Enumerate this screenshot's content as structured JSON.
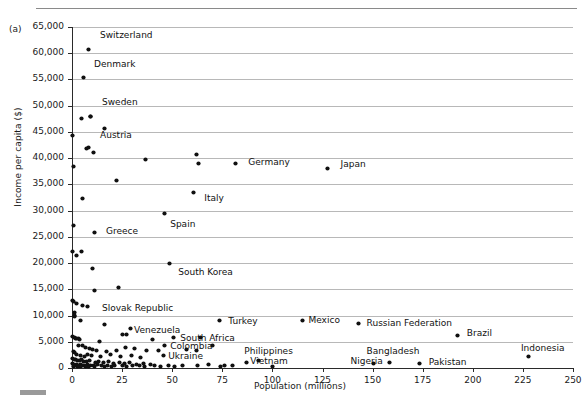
{
  "figure": {
    "panel_label": "(a)"
  },
  "chart_data": {
    "type": "scatter",
    "title": "",
    "xlabel": "Population (millions)",
    "ylabel": "Income per capita ($)",
    "xlim": [
      0,
      250
    ],
    "ylim": [
      0,
      65000
    ],
    "xticks": [
      0,
      25,
      50,
      75,
      100,
      125,
      150,
      175,
      200,
      225,
      250
    ],
    "xtick_labels": [
      "0",
      "25",
      "50",
      "75",
      "100",
      "125",
      "150",
      "175",
      "200",
      "225",
      "250"
    ],
    "yticks": [
      0,
      5000,
      10000,
      15000,
      20000,
      25000,
      30000,
      35000,
      40000,
      45000,
      50000,
      55000,
      60000,
      65000
    ],
    "ytick_labels": [
      "0",
      "5,000",
      "10,000",
      "15,000",
      "20,000",
      "25,000",
      "30,000",
      "35,000",
      "40,000",
      "45,000",
      "50,000",
      "55,000",
      "60,000",
      "65,000"
    ],
    "grid": "horizontal",
    "legend": "none",
    "marker": "filled-diamond",
    "marker_color": "#111111",
    "labeled_points": [
      {
        "name": "Switzerland",
        "x": 8.1,
        "y": 60800,
        "lx": 14,
        "ly": 63300
      },
      {
        "name": "Denmark",
        "x": 5.6,
        "y": 55300,
        "lx": 11,
        "ly": 57800
      },
      {
        "name": "Sweden",
        "x": 9.4,
        "y": 48000,
        "lx": 15,
        "ly": 50500
      },
      {
        "name": "Austria",
        "x": 8.4,
        "y": 42000,
        "lx": 14,
        "ly": 44200
      },
      {
        "name": "Germany",
        "x": 81.8,
        "y": 39000,
        "lx": 88,
        "ly": 39000
      },
      {
        "name": "Japan",
        "x": 127.6,
        "y": 38000,
        "lx": 134,
        "ly": 38600
      },
      {
        "name": "Italy",
        "x": 60.5,
        "y": 33500,
        "lx": 66,
        "ly": 32200
      },
      {
        "name": "Spain",
        "x": 46.2,
        "y": 29400,
        "lx": 49,
        "ly": 27300
      },
      {
        "name": "Greece",
        "x": 11.3,
        "y": 25800,
        "lx": 17,
        "ly": 25900
      },
      {
        "name": "South Korea",
        "x": 48.9,
        "y": 19900,
        "lx": 53,
        "ly": 18100
      },
      {
        "name": "Slovak Republic",
        "x": 5.4,
        "y": 11900,
        "lx": 15,
        "ly": 11300
      },
      {
        "name": "Venezuela",
        "x": 29.0,
        "y": 7600,
        "lx": 31,
        "ly": 7100
      },
      {
        "name": "South Africa",
        "x": 50.5,
        "y": 5800,
        "lx": 54,
        "ly": 5600
      },
      {
        "name": "Turkey",
        "x": 73.6,
        "y": 9000,
        "lx": 78,
        "ly": 8800
      },
      {
        "name": "Mexico",
        "x": 114.8,
        "y": 9100,
        "lx": 118,
        "ly": 9000
      },
      {
        "name": "Russian Federation",
        "x": 142.9,
        "y": 8500,
        "lx": 147,
        "ly": 8400
      },
      {
        "name": "Brazil",
        "x": 192.4,
        "y": 6200,
        "lx": 197,
        "ly": 6500
      },
      {
        "name": "Colombia",
        "x": 46.3,
        "y": 4200,
        "lx": 49,
        "ly": 4000
      },
      {
        "name": "Ukraine",
        "x": 45.7,
        "y": 2400,
        "lx": 48,
        "ly": 2100
      },
      {
        "name": "Philippines",
        "x": 93.3,
        "y": 1500,
        "lx": 86,
        "ly": 3000
      },
      {
        "name": "Vietnam",
        "x": 86.9,
        "y": 1000,
        "lx": 89,
        "ly": 1100
      },
      {
        "name": "Nigeria",
        "x": 158.4,
        "y": 1100,
        "lx": 139,
        "ly": 1100
      },
      {
        "name": "Bangladesh",
        "x": 150.5,
        "y": 800,
        "lx": 147,
        "ly": 3000
      },
      {
        "name": "Pakistan",
        "x": 173.6,
        "y": 900,
        "lx": 178,
        "ly": 1000
      },
      {
        "name": "Indonesia",
        "x": 228.0,
        "y": 2100,
        "lx": 224,
        "ly": 3600
      }
    ],
    "unlabeled_points": [
      {
        "x": 0.5,
        "y": 38500
      },
      {
        "x": 4.6,
        "y": 47500
      },
      {
        "x": 9.4,
        "y": 47900
      },
      {
        "x": 16.3,
        "y": 45700
      },
      {
        "x": 0.3,
        "y": 44300
      },
      {
        "x": 7.0,
        "y": 41900
      },
      {
        "x": 10.6,
        "y": 41100
      },
      {
        "x": 36.6,
        "y": 39700
      },
      {
        "x": 62.0,
        "y": 40700
      },
      {
        "x": 63.0,
        "y": 38900
      },
      {
        "x": 5.1,
        "y": 32400
      },
      {
        "x": 22.3,
        "y": 35800
      },
      {
        "x": 0.8,
        "y": 27100
      },
      {
        "x": 0.3,
        "y": 22200
      },
      {
        "x": 4.7,
        "y": 22300
      },
      {
        "x": 2.0,
        "y": 21400
      },
      {
        "x": 10.4,
        "y": 19000
      },
      {
        "x": 23.0,
        "y": 15400
      },
      {
        "x": 11.0,
        "y": 14700
      },
      {
        "x": 0.3,
        "y": 12800
      },
      {
        "x": 0.9,
        "y": 12700
      },
      {
        "x": 2.2,
        "y": 12300
      },
      {
        "x": 7.5,
        "y": 11800
      },
      {
        "x": 1.3,
        "y": 10600
      },
      {
        "x": 1.3,
        "y": 10100
      },
      {
        "x": 1.4,
        "y": 9900
      },
      {
        "x": 4.0,
        "y": 9000
      },
      {
        "x": 16.4,
        "y": 8200
      },
      {
        "x": 25.4,
        "y": 6400
      },
      {
        "x": 27.4,
        "y": 6400
      },
      {
        "x": 0.4,
        "y": 6000
      },
      {
        "x": 1.0,
        "y": 5900
      },
      {
        "x": 1.6,
        "y": 5700
      },
      {
        "x": 2.2,
        "y": 5600
      },
      {
        "x": 3.1,
        "y": 5700
      },
      {
        "x": 3.6,
        "y": 5500
      },
      {
        "x": 13.5,
        "y": 5100
      },
      {
        "x": 40.0,
        "y": 5500
      },
      {
        "x": 64.0,
        "y": 5900
      },
      {
        "x": 70.0,
        "y": 4300
      },
      {
        "x": 3.0,
        "y": 4200
      },
      {
        "x": 5.0,
        "y": 4300
      },
      {
        "x": 6.5,
        "y": 4000
      },
      {
        "x": 8.5,
        "y": 3700
      },
      {
        "x": 10.0,
        "y": 3500
      },
      {
        "x": 12.0,
        "y": 3300
      },
      {
        "x": 17.0,
        "y": 3200
      },
      {
        "x": 22.0,
        "y": 3400
      },
      {
        "x": 26.5,
        "y": 3900
      },
      {
        "x": 31.0,
        "y": 3700
      },
      {
        "x": 37.0,
        "y": 3300
      },
      {
        "x": 43.0,
        "y": 3400
      },
      {
        "x": 57.0,
        "y": 3500
      },
      {
        "x": 62.0,
        "y": 3300
      },
      {
        "x": 0.6,
        "y": 3100
      },
      {
        "x": 1.2,
        "y": 2900
      },
      {
        "x": 2.4,
        "y": 2600
      },
      {
        "x": 4.2,
        "y": 2400
      },
      {
        "x": 6.0,
        "y": 2200
      },
      {
        "x": 7.8,
        "y": 2500
      },
      {
        "x": 9.6,
        "y": 2300
      },
      {
        "x": 14.0,
        "y": 2100
      },
      {
        "x": 19.0,
        "y": 2500
      },
      {
        "x": 24.0,
        "y": 2200
      },
      {
        "x": 29.5,
        "y": 2400
      },
      {
        "x": 34.0,
        "y": 2000
      },
      {
        "x": 0.4,
        "y": 1900
      },
      {
        "x": 1.1,
        "y": 1700
      },
      {
        "x": 1.9,
        "y": 1600
      },
      {
        "x": 2.8,
        "y": 1500
      },
      {
        "x": 3.8,
        "y": 1400
      },
      {
        "x": 4.8,
        "y": 1600
      },
      {
        "x": 5.9,
        "y": 1300
      },
      {
        "x": 7.2,
        "y": 1200
      },
      {
        "x": 8.8,
        "y": 1400
      },
      {
        "x": 11.5,
        "y": 1100
      },
      {
        "x": 13.0,
        "y": 1300
      },
      {
        "x": 15.5,
        "y": 1000
      },
      {
        "x": 18.0,
        "y": 1200
      },
      {
        "x": 20.5,
        "y": 900
      },
      {
        "x": 23.5,
        "y": 1100
      },
      {
        "x": 26.0,
        "y": 800
      },
      {
        "x": 28.5,
        "y": 1000
      },
      {
        "x": 32.0,
        "y": 700
      },
      {
        "x": 35.5,
        "y": 900
      },
      {
        "x": 39.0,
        "y": 600
      },
      {
        "x": 0.2,
        "y": 800
      },
      {
        "x": 0.7,
        "y": 600
      },
      {
        "x": 1.5,
        "y": 500
      },
      {
        "x": 2.3,
        "y": 700
      },
      {
        "x": 3.2,
        "y": 400
      },
      {
        "x": 4.1,
        "y": 600
      },
      {
        "x": 5.2,
        "y": 500
      },
      {
        "x": 6.3,
        "y": 400
      },
      {
        "x": 7.6,
        "y": 600
      },
      {
        "x": 9.0,
        "y": 500
      },
      {
        "x": 10.5,
        "y": 400
      },
      {
        "x": 12.5,
        "y": 600
      },
      {
        "x": 14.5,
        "y": 500
      },
      {
        "x": 17.5,
        "y": 400
      },
      {
        "x": 21.0,
        "y": 500
      },
      {
        "x": 25.0,
        "y": 400
      },
      {
        "x": 30.0,
        "y": 500
      },
      {
        "x": 33.5,
        "y": 400
      },
      {
        "x": 41.0,
        "y": 500
      },
      {
        "x": 48.0,
        "y": 400
      },
      {
        "x": 55.0,
        "y": 500
      },
      {
        "x": 62.5,
        "y": 400
      },
      {
        "x": 68.0,
        "y": 600
      },
      {
        "x": 76.0,
        "y": 400
      },
      {
        "x": 80.0,
        "y": 500
      },
      {
        "x": 0.9,
        "y": 300
      },
      {
        "x": 2.6,
        "y": 250
      },
      {
        "x": 4.4,
        "y": 300
      },
      {
        "x": 6.8,
        "y": 200
      },
      {
        "x": 8.2,
        "y": 300
      },
      {
        "x": 11.0,
        "y": 250
      },
      {
        "x": 16.0,
        "y": 300
      },
      {
        "x": 19.5,
        "y": 200
      },
      {
        "x": 27.0,
        "y": 300
      },
      {
        "x": 36.0,
        "y": 250
      },
      {
        "x": 44.0,
        "y": 300
      },
      {
        "x": 51.0,
        "y": 200
      },
      {
        "x": 74.0,
        "y": 300
      },
      {
        "x": 100.0,
        "y": 300
      }
    ]
  }
}
